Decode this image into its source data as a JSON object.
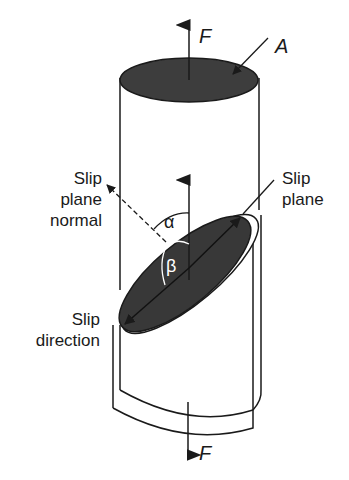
{
  "diagram": {
    "labels": {
      "force_top": "F",
      "force_bottom": "F",
      "area": "A",
      "slip_plane_normal": [
        "Slip",
        "plane",
        "normal"
      ],
      "slip_plane": [
        "Slip",
        "plane"
      ],
      "slip_direction": [
        "Slip",
        "direction"
      ],
      "alpha": "α",
      "beta": "β"
    },
    "colors": {
      "line": "#1a1a1a",
      "fill_dark": "#3a3a3a",
      "background": "#ffffff"
    }
  }
}
